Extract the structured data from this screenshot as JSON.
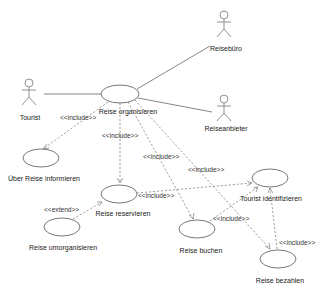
{
  "diagram": {
    "type": "uml-use-case",
    "actors": [
      {
        "id": "tourist",
        "label": "Tourist"
      },
      {
        "id": "reisebuero",
        "label": "Reisebüro"
      },
      {
        "id": "reiseanbieter",
        "label": "Reiseanbieter"
      }
    ],
    "use_cases": [
      {
        "id": "organisieren",
        "label": "Reise organisieren"
      },
      {
        "id": "informieren",
        "label": "Über Reise informieren"
      },
      {
        "id": "reservieren",
        "label": "Reise reservieren"
      },
      {
        "id": "umorganisieren",
        "label": "Reise umorganisieren"
      },
      {
        "id": "identifizieren",
        "label": "Tourist identifizieren"
      },
      {
        "id": "buchen",
        "label": "Reise buchen"
      },
      {
        "id": "bezahlen",
        "label": "Reise bezahlen"
      }
    ],
    "relations": [
      {
        "from": "tourist",
        "to": "organisieren",
        "type": "association"
      },
      {
        "from": "reisebuero",
        "to": "organisieren",
        "type": "association"
      },
      {
        "from": "reiseanbieter",
        "to": "organisieren",
        "type": "association"
      },
      {
        "from": "organisieren",
        "to": "informieren",
        "type": "include",
        "label": "<<include>>"
      },
      {
        "from": "organisieren",
        "to": "reservieren",
        "type": "include",
        "label": "<<include>>"
      },
      {
        "from": "organisieren",
        "to": "buchen",
        "type": "include",
        "label": "<<include>>"
      },
      {
        "from": "organisieren",
        "to": "bezahlen",
        "type": "include",
        "label": "<<include>>"
      },
      {
        "from": "reservieren",
        "to": "identifizieren",
        "type": "include",
        "label": "<<include>>"
      },
      {
        "from": "buchen",
        "to": "identifizieren",
        "type": "include",
        "label": "<<include>>"
      },
      {
        "from": "bezahlen",
        "to": "identifizieren",
        "type": "include",
        "label": "<<include>>"
      },
      {
        "from": "umorganisieren",
        "to": "reservieren",
        "type": "extend",
        "label": "<<extend>>"
      }
    ],
    "stereotypes": {
      "include": "<<include>>",
      "extend": "<<extend>>"
    }
  }
}
